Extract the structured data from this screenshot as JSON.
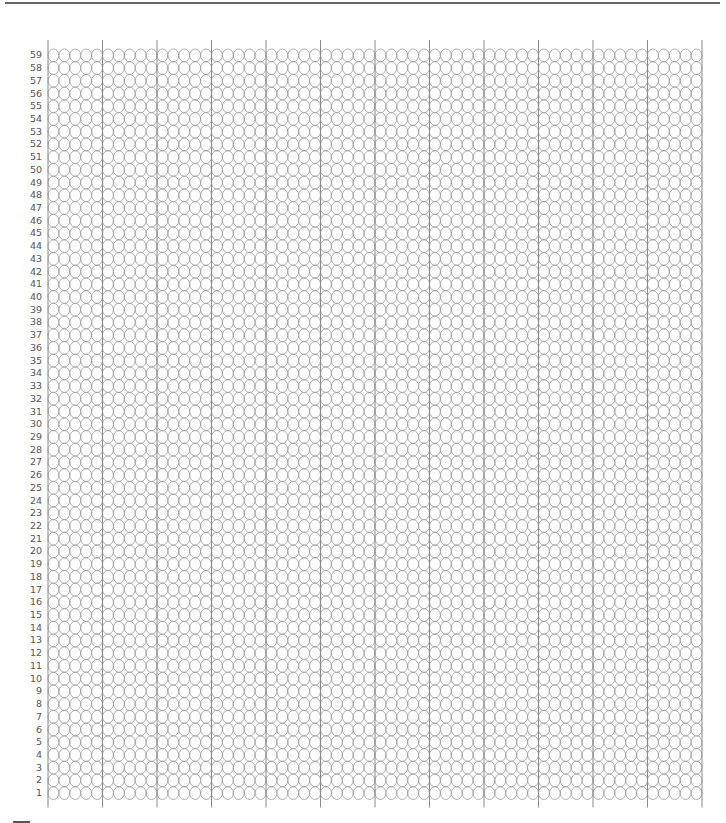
{
  "grid": {
    "rows": 59,
    "columns": 60,
    "group_size": 5,
    "row_labels_top_to_bottom": [
      "59",
      "58",
      "57",
      "56",
      "55",
      "54",
      "53",
      "52",
      "51",
      "50",
      "49",
      "48",
      "47",
      "46",
      "45",
      "44",
      "43",
      "42",
      "41",
      "40",
      "39",
      "38",
      "37",
      "36",
      "35",
      "34",
      "33",
      "32",
      "31",
      "30",
      "29",
      "28",
      "27",
      "26",
      "25",
      "24",
      "23",
      "22",
      "21",
      "20",
      "19",
      "18",
      "17",
      "16",
      "15",
      "14",
      "13",
      "12",
      "11",
      "10",
      "9",
      "8",
      "7",
      "6",
      "5",
      "4",
      "3",
      "2",
      "1"
    ],
    "cell": "empty-circle",
    "colors": {
      "circle_stroke": "#9a9a9a",
      "guide_line": "#8a8a8a",
      "label": "#555555",
      "rule": "#666666"
    }
  }
}
